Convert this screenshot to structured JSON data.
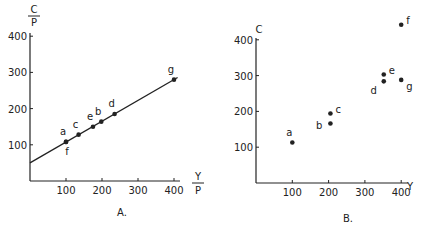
{
  "chart_data": [
    {
      "type": "line",
      "panel_label": "A.",
      "xlabel_top": "Y",
      "xlabel_bottom": "P",
      "ylabel_top": "C",
      "ylabel_bottom": "P",
      "xlim": [
        0,
        420
      ],
      "ylim": [
        0,
        420
      ],
      "x_ticks": [
        100,
        200,
        300,
        400
      ],
      "y_ticks": [
        100,
        200,
        300,
        400
      ],
      "grid": false,
      "line": {
        "intercept": 50,
        "slope": 0.575,
        "x_start": 0,
        "x_end": 410
      },
      "points": [
        {
          "label": "a",
          "x": 100,
          "y": 108,
          "label_pos": "above"
        },
        {
          "label": "f",
          "x": 100,
          "y": 108,
          "label_pos": "below"
        },
        {
          "label": "c",
          "x": 135,
          "y": 128,
          "label_pos": "above"
        },
        {
          "label": "e",
          "x": 175,
          "y": 150,
          "label_pos": "above"
        },
        {
          "label": "b",
          "x": 198,
          "y": 164,
          "label_pos": "above"
        },
        {
          "label": "d",
          "x": 235,
          "y": 185,
          "label_pos": "above"
        },
        {
          "label": "g",
          "x": 400,
          "y": 280,
          "label_pos": "above"
        }
      ]
    },
    {
      "type": "scatter",
      "panel_label": "B.",
      "xlabel": "Y",
      "ylabel": "C",
      "xlim": [
        0,
        420
      ],
      "ylim": [
        0,
        450
      ],
      "x_ticks": [
        100,
        200,
        300,
        400
      ],
      "y_ticks": [
        100,
        200,
        300,
        400
      ],
      "grid": false,
      "points": [
        {
          "label": "a",
          "x": 100,
          "y": 113,
          "label_pos": "above"
        },
        {
          "label": "b",
          "x": 205,
          "y": 166,
          "label_pos": "left"
        },
        {
          "label": "c",
          "x": 205,
          "y": 194,
          "label_pos": "right"
        },
        {
          "label": "d",
          "x": 352,
          "y": 284,
          "label_pos": "below-left"
        },
        {
          "label": "e",
          "x": 352,
          "y": 303,
          "label_pos": "right"
        },
        {
          "label": "f",
          "x": 400,
          "y": 442,
          "label_pos": "right"
        },
        {
          "label": "g",
          "x": 400,
          "y": 288,
          "label_pos": "below-right"
        }
      ]
    }
  ]
}
